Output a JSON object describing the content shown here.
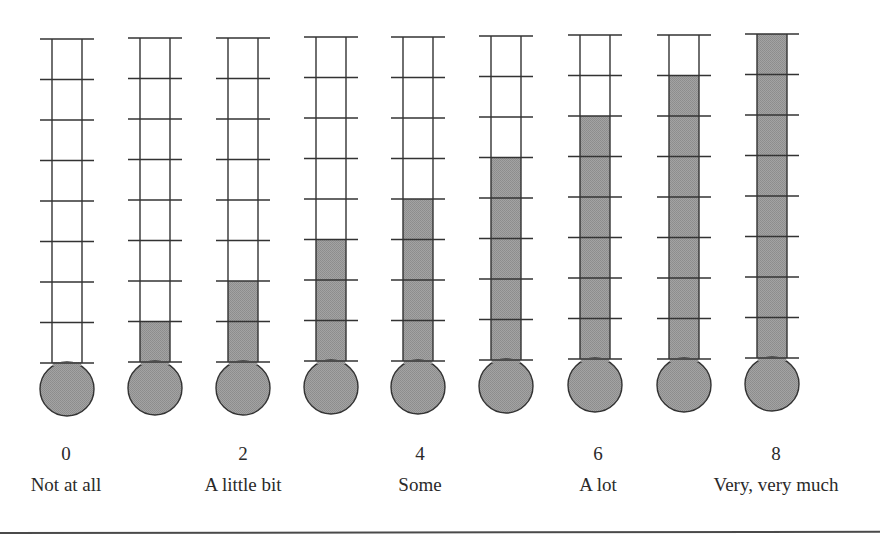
{
  "scale": {
    "title": "",
    "segments": 8,
    "colors": {
      "line": "#333333",
      "fill": "#999999",
      "bulb_fill": "#9a9a9a",
      "background": "#ffffff"
    },
    "thermometers": [
      {
        "level": 0,
        "cx": 67,
        "top": 39
      },
      {
        "level": 1,
        "cx": 155,
        "top": 38
      },
      {
        "level": 2,
        "cx": 243,
        "top": 38
      },
      {
        "level": 3,
        "cx": 331,
        "top": 37
      },
      {
        "level": 4,
        "cx": 418,
        "top": 37
      },
      {
        "level": 5,
        "cx": 506,
        "top": 36
      },
      {
        "level": 6,
        "cx": 595,
        "top": 35
      },
      {
        "level": 7,
        "cx": 684,
        "top": 35
      },
      {
        "level": 8,
        "cx": 772,
        "top": 34
      }
    ],
    "anchors": [
      {
        "value": "0",
        "label": "Not at all",
        "x": 66
      },
      {
        "value": "2",
        "label": "A little bit",
        "x": 243
      },
      {
        "value": "4",
        "label": "Some",
        "x": 420
      },
      {
        "value": "6",
        "label": "A lot",
        "x": 598
      },
      {
        "value": "8",
        "label": "Very, very much",
        "x": 776
      }
    ]
  },
  "chart_data": {
    "type": "bar",
    "title": "",
    "xlabel": "",
    "ylabel": "",
    "categories": [
      "0",
      "1",
      "2",
      "3",
      "4",
      "5",
      "6",
      "7",
      "8"
    ],
    "values": [
      0,
      1,
      2,
      3,
      4,
      5,
      6,
      7,
      8
    ],
    "ylim": [
      0,
      8
    ],
    "anchor_labels": {
      "0": "Not at all",
      "2": "A little bit",
      "4": "Some",
      "6": "A lot",
      "8": "Very, very much"
    },
    "grid": false,
    "legend": "none"
  }
}
